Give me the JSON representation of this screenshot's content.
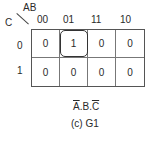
{
  "kmap": {
    "row_var": "C",
    "col_var": "AB",
    "col_headers": [
      "00",
      "01",
      "11",
      "10"
    ],
    "row_headers": [
      "0",
      "1"
    ],
    "cells": [
      [
        "0",
        "1",
        "0",
        "0"
      ],
      [
        "0",
        "0",
        "0",
        "0"
      ]
    ],
    "grouped_cells": [
      {
        "row": 0,
        "col": 1
      }
    ]
  },
  "expression": {
    "a": "A",
    "dot1": ".",
    "b": "B",
    "dot2": ".",
    "c": "C",
    "overlined": [
      "A",
      "C"
    ]
  },
  "caption": "(c) G1"
}
